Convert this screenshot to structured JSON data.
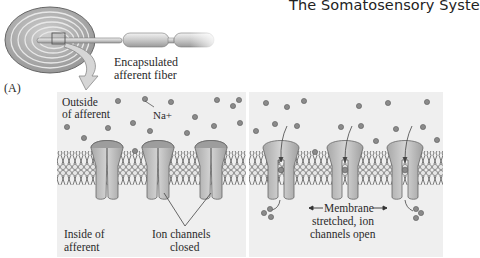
{
  "header": {
    "title": "The Somatosensory Syste"
  },
  "panel_a": {
    "letter": "(A)",
    "fiber_label_line1": "Encapsulated",
    "fiber_label_line2": "afferent fiber"
  },
  "closed_panel": {
    "outside_line1": "Outside",
    "outside_line2": "of afferent",
    "ion_label": "Na+",
    "inside_line1": "Inside of",
    "inside_line2": "afferent",
    "channels_line1": "Ion channels",
    "channels_line2": "closed"
  },
  "open_panel": {
    "line1": "Membrane",
    "line2": "stretched, ion",
    "line3": "channels open"
  },
  "colors": {
    "panel_bg": "#efefef",
    "capsule": "#a9a9a9",
    "channel": "#bdbdbd",
    "ion": "#8a8a8a",
    "membrane": "#7a7a7a"
  }
}
